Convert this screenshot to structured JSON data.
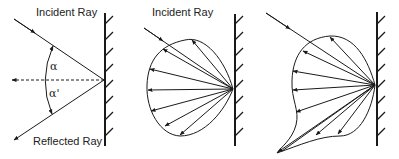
{
  "panels": [
    {
      "id": "specular",
      "labels": {
        "incident": "Incident Ray",
        "reflected": "Reflected Ray",
        "angle_in": "α",
        "angle_out": "α'"
      }
    },
    {
      "id": "diffuse",
      "labels": {
        "incident": "Incident Ray"
      }
    },
    {
      "id": "mixed",
      "labels": {}
    }
  ],
  "colors": {
    "stroke": "#1a1a1a",
    "background": "#ffffff"
  }
}
